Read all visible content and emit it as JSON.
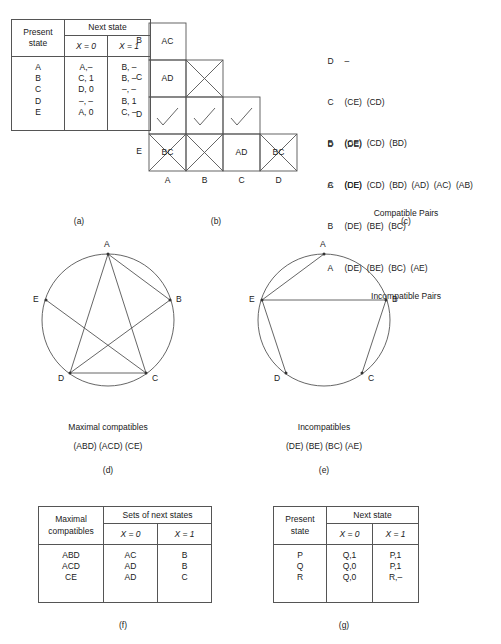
{
  "panel_a": {
    "caption": "(a)",
    "header_present_state": "Present\nstate",
    "header_next_state": "Next state",
    "col_x0": "X = 0",
    "col_x1": "X = 1",
    "states": [
      "A",
      "B",
      "C",
      "D",
      "E"
    ],
    "next_x0": [
      "A,–",
      "C, 1",
      "D, 0",
      "–, –",
      "A, 0"
    ],
    "next_x1": [
      "B, –",
      "B, –",
      "–, –",
      "B, 1",
      "C, –"
    ]
  },
  "panel_b": {
    "caption": "(b)",
    "row_labels": [
      "B",
      "C",
      "D",
      "E"
    ],
    "col_labels": [
      "A",
      "B",
      "C",
      "D"
    ],
    "cells": [
      {
        "row": "B",
        "col": "A",
        "text": "AC",
        "mark": "none"
      },
      {
        "row": "C",
        "col": "A",
        "text": "AD",
        "mark": "none"
      },
      {
        "row": "C",
        "col": "B",
        "text": "",
        "mark": "cross"
      },
      {
        "row": "D",
        "col": "A",
        "text": "",
        "mark": "check"
      },
      {
        "row": "D",
        "col": "B",
        "text": "",
        "mark": "check"
      },
      {
        "row": "D",
        "col": "C",
        "text": "",
        "mark": "check"
      },
      {
        "row": "E",
        "col": "A",
        "text": "BC",
        "mark": "cross"
      },
      {
        "row": "E",
        "col": "B",
        "text": "",
        "mark": "cross"
      },
      {
        "row": "E",
        "col": "C",
        "text": "AD",
        "mark": "none"
      },
      {
        "row": "E",
        "col": "D",
        "text": "BC",
        "mark": "cross"
      }
    ]
  },
  "panel_c": {
    "caption": "(c)",
    "compatible": {
      "title": "Compatible Pairs",
      "rows": [
        {
          "key": "D",
          "pairs": "–"
        },
        {
          "key": "C",
          "pairs": "(CE)  (CD)"
        },
        {
          "key": "B",
          "pairs": "(CE)  (CD)  (BD)"
        },
        {
          "key": "A",
          "pairs": "(CE)  (CD)  (BD)  (AD)  (AC)  (AB)"
        }
      ]
    },
    "incompatible": {
      "title": "Incompatible Pairs",
      "rows": [
        {
          "key": "D",
          "pairs": "(DE)"
        },
        {
          "key": "C",
          "pairs": "(DE)"
        },
        {
          "key": "B",
          "pairs": "(DE)  (BE)  (BC)"
        },
        {
          "key": "A",
          "pairs": "(DE)  (BE)  (BC)  (AE)"
        }
      ]
    }
  },
  "panel_d": {
    "caption": "(d)",
    "title": "Maximal compatibles",
    "subtitle": "(ABD) (ACD) (CE)",
    "vertices": [
      "A",
      "B",
      "C",
      "D",
      "E"
    ],
    "edges": [
      "AB",
      "AC",
      "AD",
      "BD",
      "CD",
      "CE"
    ]
  },
  "panel_e": {
    "caption": "(e)",
    "title": "Incompatibles",
    "subtitle": "(DE) (BE) (BC) (AE)",
    "vertices": [
      "A",
      "B",
      "C",
      "D",
      "E"
    ],
    "edges": [
      "AE",
      "BE",
      "BC",
      "DE"
    ]
  },
  "panel_f": {
    "caption": "(f)",
    "header_maximal": "Maximal\ncompatibles",
    "header_next": "Sets of next states",
    "col_x0": "X = 0",
    "col_x1": "X = 1",
    "rows_label": [
      "ABD",
      "ACD",
      "CE"
    ],
    "rows_x0": [
      "AC",
      "AD",
      "AD"
    ],
    "rows_x1": [
      "B",
      "B",
      "C"
    ]
  },
  "panel_g": {
    "caption": "(g)",
    "header_present_state": "Present\nstate",
    "header_next_state": "Next state",
    "col_x0": "X = 0",
    "col_x1": "X = 1",
    "states": [
      "P",
      "Q",
      "R"
    ],
    "next_x0": [
      "Q,1",
      "Q,0",
      "Q,0"
    ],
    "next_x1": [
      "P,1",
      "P,1",
      "R,–"
    ]
  },
  "colors": {
    "line": "#555555",
    "text": "#1a1a1a",
    "background": "#ffffff"
  }
}
